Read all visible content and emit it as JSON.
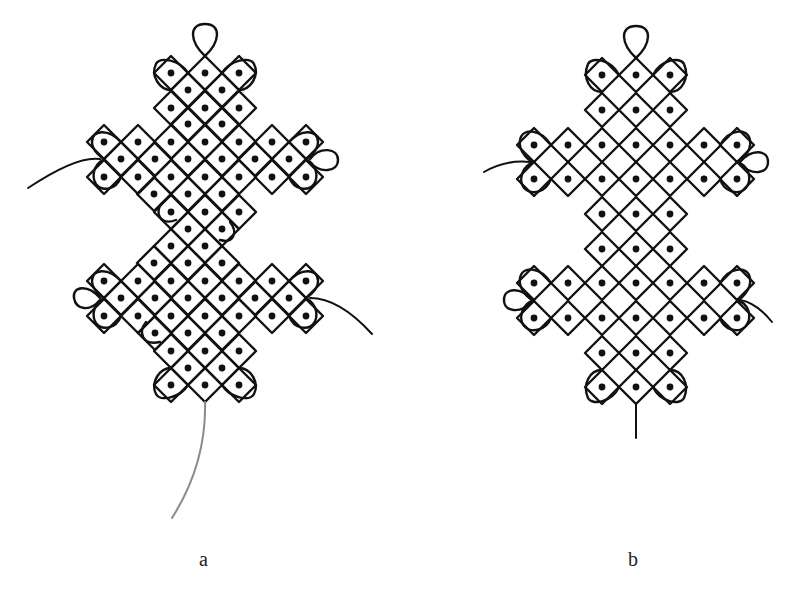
{
  "figure": {
    "panels": [
      {
        "id": "a",
        "label": "a",
        "half": 17,
        "dot_rows": [
          {
            "y": 73,
            "x": [
              171,
              205,
              239
            ]
          },
          {
            "y": 90,
            "x": [
              188,
              222
            ]
          },
          {
            "y": 108,
            "x": [
              171,
              205,
              239
            ]
          },
          {
            "y": 124,
            "x": [
              188,
              222
            ]
          },
          {
            "y": 142,
            "x": [
              104,
              138,
              171,
              205,
              239,
              272,
              306
            ]
          },
          {
            "y": 159,
            "x": [
              121,
              155,
              188,
              222,
              255,
              289
            ]
          },
          {
            "y": 177,
            "x": [
              104,
              138,
              171,
              205,
              239,
              272,
              306
            ]
          },
          {
            "y": 194,
            "x": [
              154,
              188,
              222
            ]
          },
          {
            "y": 212,
            "x": [
              171,
              205,
              239
            ]
          },
          {
            "y": 229,
            "x": [
              188,
              222
            ]
          },
          {
            "y": 246,
            "x": [
              171,
              205
            ]
          },
          {
            "y": 263,
            "x": [
              154,
              188,
              222
            ]
          },
          {
            "y": 281,
            "x": [
              104,
              138,
              171,
              205,
              239,
              272,
              306
            ]
          },
          {
            "y": 298,
            "x": [
              121,
              155,
              188,
              222,
              255,
              289
            ]
          },
          {
            "y": 316,
            "x": [
              104,
              138,
              171,
              205,
              239,
              272,
              306
            ]
          },
          {
            "y": 333,
            "x": [
              155,
              188,
              222
            ]
          },
          {
            "y": 351,
            "x": [
              171,
              205,
              239
            ]
          },
          {
            "y": 368,
            "x": [
              188,
              222
            ]
          },
          {
            "y": 385,
            "x": [
              171,
              205,
              239
            ]
          }
        ]
      },
      {
        "id": "b",
        "label": "b",
        "half": 17,
        "dot_rows": [
          {
            "y": 75,
            "x": [
              602,
              636,
              670
            ]
          },
          {
            "y": 110,
            "x": [
              602,
              636,
              670
            ]
          },
          {
            "y": 145,
            "x": [
              534,
              568,
              602,
              636,
              670,
              704,
              737
            ]
          },
          {
            "y": 179,
            "x": [
              534,
              568,
              602,
              636,
              670,
              704,
              737
            ]
          },
          {
            "y": 214,
            "x": [
              602,
              636,
              670
            ]
          },
          {
            "y": 249,
            "x": [
              602,
              636,
              670
            ]
          },
          {
            "y": 283,
            "x": [
              534,
              568,
              602,
              636,
              670,
              704,
              737
            ]
          },
          {
            "y": 318,
            "x": [
              534,
              568,
              602,
              636,
              670,
              704,
              737
            ]
          },
          {
            "y": 353,
            "x": [
              602,
              636,
              670
            ]
          },
          {
            "y": 387,
            "x": [
              602,
              636,
              670
            ]
          }
        ]
      }
    ],
    "colors": {
      "line": "#111111",
      "tail_line_a": "#8a8a8a",
      "background": "#ffffff"
    }
  }
}
